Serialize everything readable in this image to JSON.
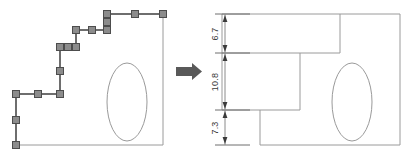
{
  "figure": {
    "type": "cad-before-after-illustration",
    "background_color": "#ffffff",
    "outline_color": "#808080",
    "selection_color": "#6e6e6e",
    "handle_fill": "#8c8c8c",
    "handle_stroke": "#4d4d4d",
    "arrow_color": "#595959",
    "dimension_color": "#3a3a3a"
  },
  "left_panel": {
    "name": "before-shape",
    "description": "stepped polygon outline with selection handles",
    "body_outline": {
      "name": "part-outline",
      "points": "16,145 163,145 163,14 107,14 107,30 76,30 76,47 60,47 60,94 16,94"
    },
    "selected_path": {
      "name": "selected-step-edges",
      "points": "16,145 16,94 60,94 60,47 76,47 76,30 107,30 107,14 163,14"
    },
    "handles": [
      {
        "name": "handle-vertex-bottom-left",
        "x": 16,
        "y": 145
      },
      {
        "name": "handle-mid-left-vertical",
        "x": 16,
        "y": 120
      },
      {
        "name": "handle-vertex-left-step",
        "x": 16,
        "y": 94
      },
      {
        "name": "handle-mid-lower-horizontal",
        "x": 38,
        "y": 94
      },
      {
        "name": "handle-vertex-lower-step",
        "x": 60,
        "y": 94
      },
      {
        "name": "handle-mid-mid-vertical",
        "x": 60,
        "y": 71
      },
      {
        "name": "handle-vertex-mid-step",
        "x": 60,
        "y": 47
      },
      {
        "name": "handle-mid-mid-horizontal",
        "x": 68,
        "y": 47
      },
      {
        "name": "handle-vertex-upper-step-low",
        "x": 76,
        "y": 47
      },
      {
        "name": "handle-vertex-upper-step-high",
        "x": 76,
        "y": 30
      },
      {
        "name": "handle-mid-upper-horizontal",
        "x": 92,
        "y": 30
      },
      {
        "name": "handle-vertex-top-step",
        "x": 107,
        "y": 30
      },
      {
        "name": "handle-mid-top-vertical",
        "x": 107,
        "y": 22
      },
      {
        "name": "handle-vertex-top-inner",
        "x": 107,
        "y": 14
      },
      {
        "name": "handle-mid-top-horizontal",
        "x": 135,
        "y": 14
      },
      {
        "name": "handle-vertex-top-right",
        "x": 163,
        "y": 14
      }
    ],
    "ellipse": {
      "name": "part-hole-ellipse",
      "cx": 127,
      "cy": 102,
      "rx": 20,
      "ry": 39
    }
  },
  "arrow": {
    "name": "transform-arrow",
    "direction": "right",
    "x": 176,
    "y": 63,
    "width": 26,
    "height": 17
  },
  "right_panel": {
    "name": "after-shape",
    "description": "resulting stepped part with vertical dimension chain",
    "body_outline": {
      "name": "part-outline",
      "points": "222,53 222,110 260,110 260,145 400,145 400,14 340,14 340,53"
    },
    "extra_edges": [
      {
        "name": "upper-step-edge",
        "points": "222,14 222,53 300,53 300,110"
      },
      {
        "name": "lower-step-edge",
        "points": "222,110 260,110"
      }
    ],
    "ellipse": {
      "name": "part-hole-ellipse",
      "cx": 352,
      "cy": 102,
      "rx": 20,
      "ry": 39
    },
    "dimensions": {
      "name": "vertical-dimension-chain",
      "axis_x": 225,
      "entries": [
        {
          "name": "dimension-6-7",
          "label": "6.7",
          "from_y": 14,
          "to_y": 53
        },
        {
          "name": "dimension-10-8",
          "label": "10.8",
          "from_y": 53,
          "to_y": 110
        },
        {
          "name": "dimension-7-3",
          "label": "7.3",
          "from_y": 110,
          "to_y": 145
        }
      ],
      "extension_lines": [
        {
          "name": "ext-line-top",
          "y": 14,
          "x1": 215,
          "x2": 250
        },
        {
          "name": "ext-line-mid-upper",
          "y": 53,
          "x1": 215,
          "x2": 250
        },
        {
          "name": "ext-line-mid-lower",
          "y": 110,
          "x1": 215,
          "x2": 250
        },
        {
          "name": "ext-line-bottom",
          "y": 145,
          "x1": 215,
          "x2": 250
        }
      ]
    }
  }
}
